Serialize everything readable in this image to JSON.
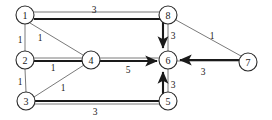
{
  "figure": {
    "kind": "directed-weighted-graph-diagram",
    "background_color": "#ffffff",
    "node_fill": "#ffffff",
    "node_stroke": "#2b2b2b",
    "thin_edge_color": "#7a7a7a",
    "thick_edge_color": "#1a1a1a"
  },
  "nodes": [
    {
      "id": "1",
      "label": "1",
      "cx": 25,
      "cy": 15,
      "r": 9
    },
    {
      "id": "2",
      "label": "2",
      "cx": 25,
      "cy": 60,
      "r": 9
    },
    {
      "id": "3",
      "label": "3",
      "cx": 26,
      "cy": 101,
      "r": 9
    },
    {
      "id": "4",
      "label": "4",
      "cx": 91,
      "cy": 60,
      "r": 9
    },
    {
      "id": "5",
      "label": "5",
      "cx": 168,
      "cy": 101,
      "r": 9
    },
    {
      "id": "6",
      "label": "6",
      "cx": 168,
      "cy": 60,
      "r": 9
    },
    {
      "id": "7",
      "label": "7",
      "cx": 248,
      "cy": 62,
      "r": 9
    },
    {
      "id": "8",
      "label": "8",
      "cx": 168,
      "cy": 15,
      "r": 9
    }
  ],
  "edges": [
    {
      "id": "e-1-8",
      "from": "1",
      "to": "8",
      "weight": "3",
      "weight_x": 94,
      "weight_y": 10,
      "style": "thin",
      "directed": false
    },
    {
      "id": "e-1-2",
      "from": "1",
      "to": "2",
      "weight": "1",
      "weight_x": 20,
      "weight_y": 40,
      "style": "thin",
      "directed": false
    },
    {
      "id": "e-1-4",
      "from": "1",
      "to": "4",
      "weight": "1",
      "weight_x": 40,
      "weight_y": 38,
      "style": "thin",
      "directed": false
    },
    {
      "id": "e-2-3",
      "from": "2",
      "to": "3",
      "weight": "1",
      "weight_x": 20,
      "weight_y": 82,
      "style": "thin",
      "directed": false
    },
    {
      "id": "e-2-4",
      "from": "2",
      "to": "4",
      "weight": "1",
      "weight_x": 53,
      "weight_y": 68,
      "style": "thin",
      "directed": false
    },
    {
      "id": "e-3-4",
      "from": "3",
      "to": "4",
      "weight": "1",
      "weight_x": 63,
      "weight_y": 88,
      "style": "thin",
      "directed": false
    },
    {
      "id": "e-4-6",
      "from": "4",
      "to": "6",
      "weight": "5",
      "weight_x": 128,
      "weight_y": 70,
      "style": "thick",
      "directed": true
    },
    {
      "id": "e-8-6",
      "from": "8",
      "to": "6",
      "weight": "3",
      "weight_x": 173,
      "weight_y": 36,
      "style": "thin",
      "directed": false
    },
    {
      "id": "e-6-5",
      "from": "6",
      "to": "5",
      "weight": "3",
      "weight_x": 173,
      "weight_y": 85,
      "style": "thin",
      "directed": false
    },
    {
      "id": "e-8-7",
      "from": "8",
      "to": "7",
      "weight": "1",
      "weight_x": 212,
      "weight_y": 36,
      "style": "thin",
      "directed": false
    },
    {
      "id": "e-7-6",
      "from": "7",
      "to": "6",
      "weight": "3",
      "weight_x": 203,
      "weight_y": 72,
      "style": "thick",
      "directed": true
    },
    {
      "id": "e-3-5",
      "from": "3",
      "to": "5",
      "weight": "3",
      "weight_x": 95,
      "weight_y": 112,
      "style": "thick",
      "directed": true
    }
  ],
  "paths": {
    "path_1_to_6": {
      "label": "thick route from node 1 across to node 6",
      "weight_shown": "3"
    },
    "path_3_to_6": {
      "label": "thick route from node 3 across to node 6",
      "weight_shown": "3"
    }
  }
}
